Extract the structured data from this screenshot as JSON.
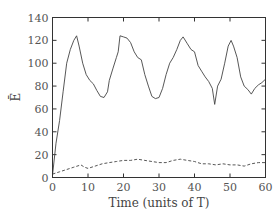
{
  "chart_data": {
    "type": "line",
    "title": "",
    "xlabel": "Time (units of T)",
    "ylabel": "Ē",
    "xlim": [
      0,
      60
    ],
    "ylim": [
      0,
      140
    ],
    "xticks": [
      0,
      10,
      20,
      30,
      40,
      50,
      60
    ],
    "yticks": [
      0,
      20,
      40,
      60,
      80,
      100,
      120,
      140
    ],
    "grid": false,
    "legend": null,
    "series": [
      {
        "name": "solid",
        "style": "solid",
        "x": [
          0,
          1,
          2,
          3,
          4,
          5,
          6,
          6.8,
          7.5,
          8.5,
          9.5,
          10.5,
          11.5,
          12.5,
          13.5,
          14.5,
          15.5,
          16,
          17,
          18,
          18.5,
          19,
          20,
          21,
          22,
          23,
          24,
          25,
          26,
          27,
          28,
          29,
          30,
          31,
          32,
          33,
          34,
          35,
          36,
          36.8,
          38,
          39,
          40,
          41,
          42,
          43,
          44,
          45,
          45.7,
          46.5,
          47.5,
          48.5,
          49.5,
          50.3,
          51,
          52,
          53,
          54,
          55,
          56,
          57,
          58,
          59,
          60
        ],
        "y": [
          2,
          30,
          50,
          75,
          100,
          112,
          120,
          124,
          115,
          100,
          90,
          85,
          82,
          76,
          71,
          70,
          75,
          85,
          95,
          105,
          110,
          124,
          123,
          122,
          118,
          110,
          105,
          103,
          90,
          80,
          71,
          69,
          70,
          78,
          90,
          100,
          105,
          112,
          120,
          123,
          117,
          112,
          110,
          98,
          93,
          88,
          84,
          78,
          64,
          80,
          86,
          100,
          115,
          120,
          115,
          105,
          88,
          80,
          77,
          73,
          78,
          81,
          83,
          86
        ]
      },
      {
        "name": "dashed",
        "style": "dashed",
        "x": [
          0,
          2,
          4,
          6,
          8,
          9,
          10,
          12,
          14,
          16,
          18,
          20,
          22,
          24,
          26,
          28,
          30,
          32,
          34,
          36,
          38,
          40,
          42,
          44,
          46,
          48,
          50,
          52,
          54,
          56,
          58,
          60
        ],
        "y": [
          3,
          5,
          7,
          9,
          11,
          9,
          8,
          10,
          12,
          13,
          14,
          15,
          15,
          16,
          15,
          14,
          13,
          13,
          15,
          16,
          15,
          14,
          12,
          12,
          11,
          12,
          11,
          11,
          10,
          12,
          13,
          13
        ]
      }
    ]
  },
  "axes": {
    "xlabel": "Time (units of T)",
    "ylabel": "Ē"
  }
}
